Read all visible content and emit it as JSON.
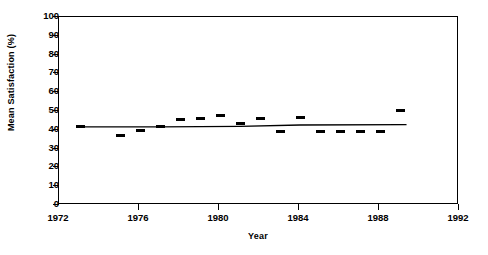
{
  "chart_data": {
    "type": "scatter",
    "title": "",
    "xlabel": "Year",
    "ylabel": "Mean Satisfaction (%)",
    "xlim": [
      1972,
      1992
    ],
    "ylim": [
      0,
      100
    ],
    "xticks": [
      1972,
      1976,
      1980,
      1984,
      1988,
      1992
    ],
    "xtick_labels": [
      "1972",
      "1976",
      "1980",
      "1984",
      "1988",
      "1992"
    ],
    "yticks": [
      0,
      10,
      20,
      30,
      40,
      50,
      60,
      70,
      80,
      90,
      100
    ],
    "ytick_labels": [
      "0",
      "10",
      "20",
      "30",
      "40",
      "50",
      "60",
      "70",
      "80",
      "90",
      "100"
    ],
    "grid": false,
    "legend": false,
    "marker_color": "#000000",
    "line_color": "#000000",
    "x": [
      1973.1,
      1975.1,
      1976.1,
      1977.1,
      1978.1,
      1979.1,
      1980.1,
      1981.1,
      1982.1,
      1983.1,
      1984.1,
      1985.1,
      1986.1,
      1987.1,
      1988.1,
      1989.1
    ],
    "y": [
      41,
      36.5,
      39,
      41,
      45,
      45.5,
      47,
      43,
      45.5,
      38.5,
      46,
      38.5,
      38.5,
      38.5,
      38.5,
      50
    ],
    "series": [
      {
        "name": "Mean Satisfaction",
        "style": "marker",
        "x": [
          1973.1,
          1975.1,
          1976.1,
          1977.1,
          1978.1,
          1979.1,
          1980.1,
          1981.1,
          1982.1,
          1983.1,
          1984.1,
          1985.1,
          1986.1,
          1987.1,
          1988.1,
          1989.1
        ],
        "values": [
          41,
          36.5,
          39,
          41,
          45,
          45.5,
          47,
          43,
          45.5,
          38.5,
          46,
          38.5,
          38.5,
          38.5,
          38.5,
          50
        ]
      },
      {
        "name": "Trend line",
        "style": "line",
        "x": [
          1973.1,
          1977.1,
          1981.1,
          1984.1,
          1989.4
        ],
        "values": [
          41,
          41,
          41.3,
          42,
          42.2
        ]
      }
    ]
  },
  "axes": {
    "y_title": "Mean Satisfaction (%)",
    "x_title": "Year"
  }
}
